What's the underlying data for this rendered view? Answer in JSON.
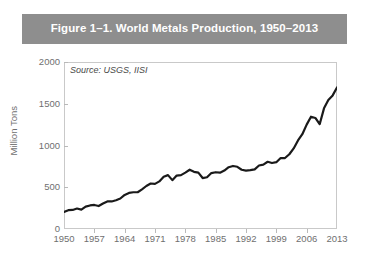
{
  "figure": {
    "title": "Figure 1–1. World Metals Production, 1950–2013",
    "banner_color": "#8e8e8e",
    "title_color": "#ffffff"
  },
  "source_note": "Source: USGS, IISI",
  "chart_data": {
    "type": "line",
    "title": "Figure 1–1. World Metals Production, 1950–2013",
    "xlabel": "",
    "ylabel": "Million Tons",
    "xlim": [
      1950,
      2013
    ],
    "ylim": [
      0,
      2000
    ],
    "grid": false,
    "legend": "none",
    "line_color": "#1a1a1a",
    "line_width": 2.2,
    "annotation": "Source: USGS, IISI",
    "xticks": [
      1950,
      1957,
      1964,
      1971,
      1978,
      1985,
      1992,
      1999,
      2006,
      2013
    ],
    "yticks": [
      0,
      500,
      1000,
      1500,
      2000
    ],
    "series": [
      {
        "name": "World Metals Production",
        "x": [
          1950,
          1951,
          1952,
          1953,
          1954,
          1955,
          1956,
          1957,
          1958,
          1959,
          1960,
          1961,
          1962,
          1963,
          1964,
          1965,
          1966,
          1967,
          1968,
          1969,
          1970,
          1971,
          1972,
          1973,
          1974,
          1975,
          1976,
          1977,
          1978,
          1979,
          1980,
          1981,
          1982,
          1983,
          1984,
          1985,
          1986,
          1987,
          1988,
          1989,
          1990,
          1991,
          1992,
          1993,
          1994,
          1995,
          1996,
          1997,
          1998,
          1999,
          2000,
          2001,
          2002,
          2003,
          2004,
          2005,
          2006,
          2007,
          2008,
          2009,
          2010,
          2011,
          2012,
          2013
        ],
        "values": [
          205,
          225,
          228,
          245,
          232,
          268,
          282,
          288,
          275,
          305,
          330,
          330,
          345,
          365,
          408,
          432,
          440,
          440,
          475,
          515,
          545,
          540,
          570,
          625,
          645,
          585,
          640,
          645,
          675,
          710,
          685,
          675,
          610,
          620,
          670,
          680,
          675,
          700,
          740,
          755,
          745,
          710,
          700,
          705,
          715,
          760,
          770,
          805,
          790,
          800,
          850,
          850,
          895,
          965,
          1060,
          1135,
          1250,
          1345,
          1330,
          1255,
          1445,
          1545,
          1600,
          1695
        ]
      }
    ]
  }
}
